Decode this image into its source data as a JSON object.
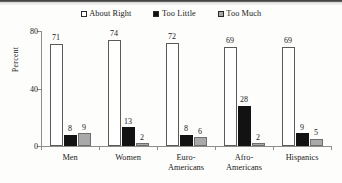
{
  "chart_data": {
    "type": "bar",
    "title": "",
    "subtitle": "",
    "xlabel": "",
    "ylabel": "Percent",
    "ylim": [
      0,
      80
    ],
    "yticks": [
      0,
      40,
      80
    ],
    "ytick_labels": [
      "0",
      "40",
      "80"
    ],
    "grid": false,
    "legend_position": "top-center",
    "categories": [
      "Men",
      "Women",
      "Euro-Americans",
      "Afro-Americans",
      "Hispanics"
    ],
    "category_lines": [
      [
        "Men"
      ],
      [
        "Women"
      ],
      [
        "Euro-",
        "Americans"
      ],
      [
        "Afro-",
        "Americans"
      ],
      [
        "Hispanics"
      ]
    ],
    "series": [
      {
        "name": "About Right",
        "color": "#ffffff",
        "values": [
          71,
          74,
          72,
          69,
          69
        ],
        "labels": [
          "71",
          "74",
          "72",
          "69",
          "69"
        ]
      },
      {
        "name": "Too Little",
        "color": "#121212",
        "values": [
          8,
          13,
          8,
          28,
          9
        ],
        "labels": [
          "8",
          "13",
          "8",
          "28",
          "9"
        ]
      },
      {
        "name": "Too Much",
        "color": "#a9a9a9",
        "values": [
          9,
          2,
          6,
          2,
          5
        ],
        "labels": [
          "9",
          "2",
          "6",
          "2",
          "5"
        ]
      }
    ]
  },
  "axis": {
    "y_label": "Percent"
  }
}
